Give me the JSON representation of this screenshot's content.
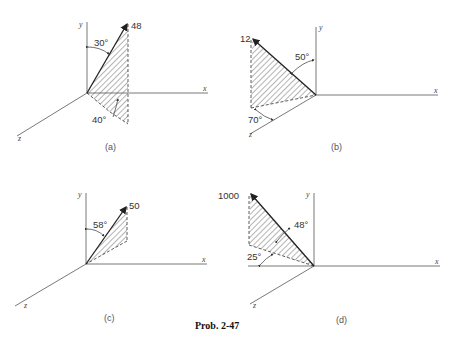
{
  "problem_label": "Prob. 2-47",
  "figures": [
    {
      "id": "a",
      "caption": "(a)",
      "magnitude": "48",
      "angles": [
        "30°",
        "40°"
      ],
      "axes": {
        "x": "x",
        "y": "y",
        "z": "z"
      }
    },
    {
      "id": "b",
      "caption": "(b)",
      "magnitude": "12",
      "angles": [
        "50°",
        "70°"
      ],
      "axes": {
        "x": "x",
        "y": "y",
        "z": "z"
      }
    },
    {
      "id": "c",
      "caption": "(c)",
      "magnitude": "50",
      "angles": [
        "58°"
      ],
      "axes": {
        "x": "x",
        "y": "y",
        "z": "z"
      }
    },
    {
      "id": "d",
      "caption": "(d)",
      "magnitude": "1000",
      "angles": [
        "48°",
        "25°"
      ],
      "axes": {
        "x": "x",
        "y": "y",
        "z": "z"
      }
    }
  ],
  "colors": {
    "line": "#222222",
    "axis": "#555555",
    "background": "#ffffff"
  }
}
